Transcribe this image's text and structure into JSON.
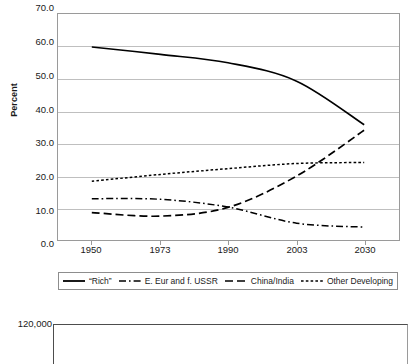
{
  "chart_data": [
    {
      "type": "line",
      "title": "",
      "xlabel": "",
      "ylabel": "Percent",
      "categories": [
        "1950",
        "1973",
        "1990",
        "2003",
        "2030"
      ],
      "ylim": [
        0,
        70
      ],
      "yticks": [
        "0.0",
        "10.0",
        "20.0",
        "30.0",
        "40.0",
        "50.0",
        "60.0",
        "70.0"
      ],
      "ytick_values": [
        0,
        10,
        20,
        30,
        40,
        50,
        60,
        70
      ],
      "grid": true,
      "legend_position": "bottom",
      "series": [
        {
          "name": "“Rich”",
          "style": "solid",
          "color": "#000000",
          "values": [
            59.8,
            57.5,
            54.9,
            49.2,
            35.7
          ]
        },
        {
          "name": "E. Eur and f. USSR",
          "style": "dash-dot",
          "color": "#000000",
          "values": [
            12.8,
            12.6,
            10.2,
            5.2,
            4.0
          ]
        },
        {
          "name": "China/India",
          "style": "long-dash",
          "color": "#000000",
          "values": [
            8.5,
            7.4,
            10.1,
            19.8,
            34.0
          ]
        },
        {
          "name": "Other Developing",
          "style": "dotted",
          "color": "#000000",
          "values": [
            18.2,
            20.3,
            22.1,
            23.7,
            24.0
          ]
        }
      ]
    },
    {
      "type": "line",
      "title": "",
      "note": "second figure cropped at bottom edge of screenshot",
      "yticks": [
        "120,000"
      ],
      "ytick_values": [
        120000
      ],
      "categories": [],
      "series": []
    }
  ],
  "top_chart": {
    "ylabel": "Percent",
    "yticks": [
      "70.0",
      "60.0",
      "50.0",
      "40.0",
      "30.0",
      "20.0",
      "10.0",
      "0.0"
    ],
    "xticks": [
      "1950",
      "1973",
      "1990",
      "2003",
      "2030"
    ],
    "legend": [
      {
        "label": "“Rich”",
        "style": "solid"
      },
      {
        "label": "E. Eur and f. USSR",
        "style": "dash-dot"
      },
      {
        "label": "China/India",
        "style": "long-dash"
      },
      {
        "label": "Other Developing",
        "style": "dotted"
      }
    ]
  },
  "bottom_chart": {
    "ytick_top": "120,000"
  },
  "colors": {
    "line": "#000000",
    "grid": "#bfbfbf",
    "axis": "#9a9a9a",
    "text": "#1a1a1a",
    "background": "#ffffff"
  }
}
